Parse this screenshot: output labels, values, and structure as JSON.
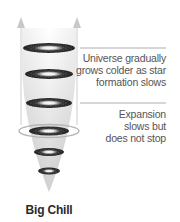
{
  "diagram": {
    "title_label": "Big Chill",
    "annotations": [
      {
        "lines": [
          "Universe gradually",
          "grows colder as star",
          "formation slows"
        ]
      },
      {
        "lines": [
          "Expansion",
          "slows but",
          "does not stop"
        ]
      }
    ],
    "icons": {
      "left_arrow": "arrow-up-icon",
      "right_arrow": "arrow-up-icon",
      "galaxies": "galaxy-disk-icon"
    },
    "colors": {
      "cone_light": "#f4f4f4",
      "cone_dark": "#cfcfcf",
      "arrow": "#c8c8c8",
      "galaxy": "#2b2b2b",
      "leader_line": "#9a9a9a",
      "text": "#555555",
      "label": "#2a2a2a"
    }
  }
}
